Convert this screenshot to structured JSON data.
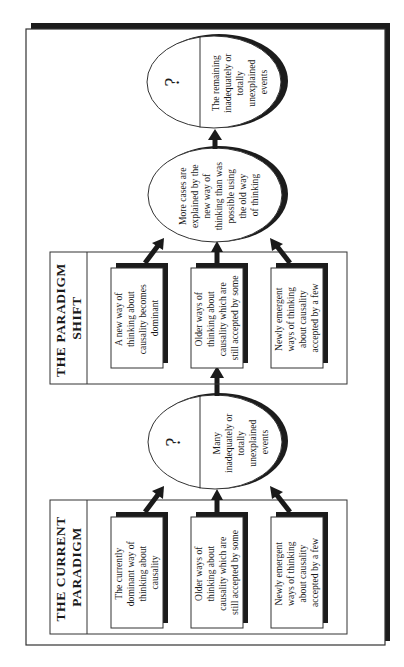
{
  "diagram": {
    "colors": {
      "ink": "#1a1a1a",
      "shadow": "#1c1c1c",
      "background": "#ffffff"
    },
    "orientation": "rotated-90-ccw",
    "current_paradigm": {
      "title_lines": [
        "THE CURRENT",
        "PARADIGM"
      ],
      "boxes": [
        {
          "lines": [
            "The currently",
            "dominant way of",
            "thinking about",
            "causality"
          ]
        },
        {
          "lines": [
            "Older ways of",
            "thinking about",
            "causality which are",
            "still accepted by some"
          ]
        },
        {
          "lines": [
            "Newly emergent",
            "ways of thinking",
            "about causality",
            "accepted by a few"
          ]
        }
      ]
    },
    "ellipse_unexplained_1": {
      "symbol": "?",
      "lines": [
        "Many",
        "inadequately or",
        "totally",
        "unexplained",
        "events"
      ]
    },
    "paradigm_shift": {
      "title_lines": [
        "THE PARADIGM",
        "SHIFT"
      ],
      "boxes": [
        {
          "lines": [
            "A new way of",
            "thinking about",
            "causality becomes",
            "dominant"
          ]
        },
        {
          "lines": [
            "Older ways of",
            "thinking about",
            "causality which are",
            "still accepted by some"
          ]
        },
        {
          "lines": [
            "Newly emergent",
            "ways of thinking",
            "about causality",
            "accepted by a few"
          ]
        }
      ]
    },
    "ellipse_more_cases": {
      "lines": [
        "More cases are",
        "explained by the",
        "new way of",
        "thinking than was",
        "possible using",
        "the old way",
        "of thinking"
      ]
    },
    "ellipse_unexplained_2": {
      "symbol": "?",
      "lines": [
        "The remaining",
        "inadequately or",
        "totally",
        "unexplained",
        "events"
      ]
    }
  }
}
